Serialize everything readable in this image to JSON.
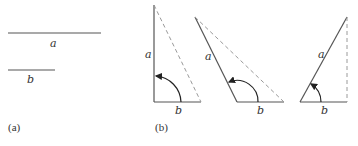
{
  "figure": {
    "panel_a": {
      "caption": "(a)",
      "segments": [
        {
          "label": "a",
          "x1": 8,
          "x2": 101,
          "y": 33
        },
        {
          "label": "b",
          "x1": 8,
          "x2": 55,
          "y": 70
        }
      ]
    },
    "panel_b": {
      "caption": "(b)",
      "triangles": [
        {
          "side_a_label": "a",
          "side_b_label": "b",
          "angle": "right (90°)"
        },
        {
          "side_a_label": "a",
          "side_b_label": "b",
          "angle": "obtuse"
        },
        {
          "side_a_label": "a",
          "side_b_label": "b",
          "angle": "acute"
        }
      ]
    },
    "colors": {
      "solid_line": "#555555",
      "dashed_line": "#9a9a9a",
      "arc": "#222222",
      "text": "#333333"
    }
  }
}
